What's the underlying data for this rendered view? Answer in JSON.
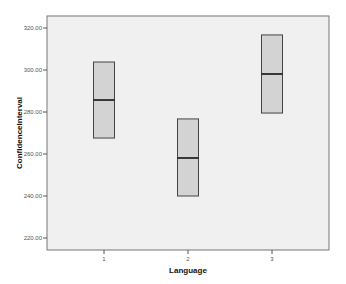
{
  "chart_data": {
    "type": "boxplot",
    "title": "",
    "xlabel": "Language",
    "ylabel": "ConfidenceInterval",
    "categories": [
      "1",
      "2",
      "3"
    ],
    "series": [
      {
        "name": "ConfidenceInterval",
        "boxes": [
          {
            "category": "1",
            "low": 267.6,
            "median": 285.7,
            "high": 303.8
          },
          {
            "category": "2",
            "low": 240.0,
            "median": 258.1,
            "high": 276.7
          },
          {
            "category": "3",
            "low": 279.5,
            "median": 298.1,
            "high": 316.7
          }
        ]
      }
    ],
    "yticks": [
      "220.00",
      "240.00",
      "260.00",
      "280.00",
      "300.00",
      "320.00"
    ],
    "ylim": [
      214,
      323
    ],
    "grid": false,
    "legend": null
  },
  "colors": {
    "plot_background": "#f0f0f0",
    "box_fill": "#d3d3d3",
    "box_edge": "#444444",
    "median_line": "#111111",
    "frame": "#777777"
  }
}
